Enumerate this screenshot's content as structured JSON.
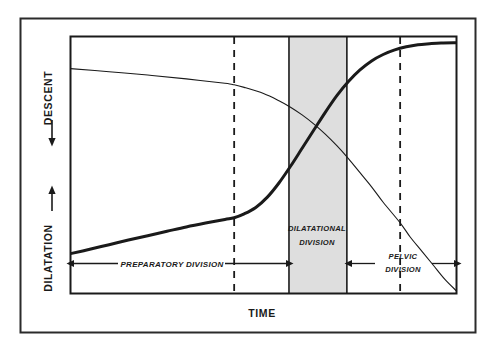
{
  "figure": {
    "name": "friedman-labor-curve",
    "background_color": "#ffffff",
    "border_color": "#2b2b2b",
    "ink_color": "#1a1a1a",
    "shaded_band_color": "#dedede"
  },
  "axes": {
    "y_upper_label": "DESCENT",
    "y_upper_arrow": "arrow-down",
    "y_lower_label": "DILATATION",
    "y_lower_arrow": "arrow-up",
    "x_label": "TIME"
  },
  "phases": [
    {
      "id": "preparatory",
      "label_line1": "PREPARATORY  DIVISION",
      "label_line2": "",
      "arrow_style": "double-headed"
    },
    {
      "id": "dilatational",
      "label_line1": "DILATATIONAL",
      "label_line2": "DIVISION",
      "arrow_style": "none"
    },
    {
      "id": "pelvic",
      "label_line1": "PELVIC",
      "label_line2": "DIVISION",
      "arrow_style": "double-headed"
    }
  ],
  "chart_data": {
    "type": "line",
    "title": "",
    "subtitle": "",
    "xlabel": "TIME",
    "ylabel": "DILATATION / DESCENT",
    "xlim": [
      0,
      100
    ],
    "ylim": [
      0,
      100
    ],
    "grid": false,
    "legend_position": "none",
    "annotations": [
      {
        "text": "PREPARATORY  DIVISION",
        "x": 24,
        "y": 13
      },
      {
        "text": "DILATATIONAL",
        "x": 49,
        "y": 28
      },
      {
        "text": "DIVISION",
        "x": 49,
        "y": 22
      },
      {
        "text": "PELVIC",
        "x": 79,
        "y": 18
      },
      {
        "text": "DIVISION",
        "x": 79,
        "y": 12
      }
    ],
    "shaded_region": {
      "label": "dilatational-division-band",
      "x_start": 56.6,
      "x_end": 71.6,
      "color": "#dedede"
    },
    "vertical_dashed_lines": [
      {
        "label": "acceleration-marker",
        "x": 42.4
      },
      {
        "label": "deceleration-marker",
        "x": 85.4
      }
    ],
    "series": [
      {
        "name": "DILATATION",
        "style": "thick-solid",
        "x": [
          0,
          5,
          10,
          15,
          20,
          25,
          30,
          35,
          40,
          42.4,
          45,
          48,
          51,
          54,
          57,
          60,
          63,
          66,
          69,
          72,
          75,
          78,
          81,
          84,
          87,
          90,
          93,
          96,
          100
        ],
        "y": [
          15.5,
          17.2,
          19.0,
          20.8,
          22.5,
          24.2,
          25.9,
          27.4,
          28.8,
          29.5,
          31.0,
          33.5,
          37.5,
          43.0,
          49.5,
          56.5,
          63.5,
          70.5,
          77.0,
          82.5,
          87.0,
          90.5,
          93.0,
          94.8,
          96.0,
          96.8,
          97.2,
          97.5,
          97.6
        ]
      },
      {
        "name": "DESCENT",
        "style": "thin-solid",
        "x": [
          0,
          10,
          20,
          30,
          40,
          42.4,
          45,
          50,
          54,
          57,
          60,
          63,
          66,
          69,
          72,
          75,
          78,
          81,
          85.4,
          88,
          91,
          94,
          97,
          100
        ],
        "y": [
          87.5,
          86.3,
          85.0,
          83.5,
          81.8,
          81.2,
          80.2,
          77.8,
          75.0,
          72.5,
          69.5,
          66.0,
          62.0,
          57.5,
          52.5,
          47.0,
          41.5,
          35.5,
          27.5,
          22.0,
          16.5,
          11.0,
          5.5,
          1.0
        ]
      }
    ]
  }
}
